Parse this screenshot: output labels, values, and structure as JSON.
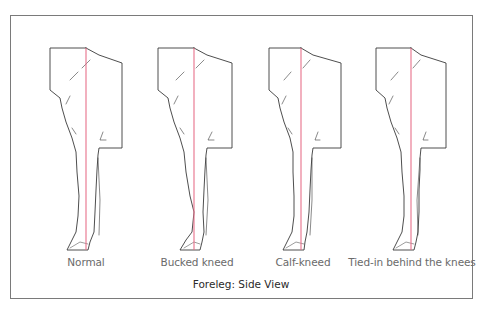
{
  "figure": {
    "title": "Foreleg: Side View",
    "colors": {
      "outline": "#3a3a3a",
      "plumb_line": "#e8708a",
      "frame": "#7a7a7a",
      "label_text": "#6a6a6a"
    },
    "panels": [
      {
        "id": "normal",
        "label": "Normal",
        "center_x": 86
      },
      {
        "id": "bucked-kneed",
        "label": "Bucked kneed",
        "center_x": 197
      },
      {
        "id": "calf-kneed",
        "label": "Calf-kneed",
        "center_x": 303
      },
      {
        "id": "tied-in",
        "label": "Tied-in behind the knees",
        "center_x": 412
      }
    ]
  }
}
